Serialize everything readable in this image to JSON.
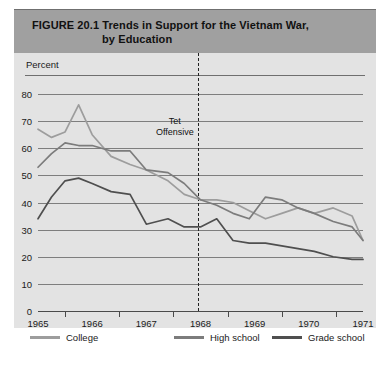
{
  "figure": {
    "number": "FIGURE 20.1",
    "title_line1": "Trends in Support for the Vietnam War,",
    "title_line2": "by Education"
  },
  "axis": {
    "y_title": "Percent",
    "y_ticks": [
      "80",
      "70",
      "60",
      "50",
      "40",
      "30",
      "20",
      "10",
      "0"
    ],
    "x_ticks": [
      "1965",
      "1966",
      "1967",
      "1968",
      "1969",
      "1970",
      "1971"
    ]
  },
  "annotation": {
    "tet_line1": "Tet",
    "tet_line2": "Offensive"
  },
  "legend": {
    "items": [
      {
        "label": "College",
        "color": "#9d9d9d"
      },
      {
        "label": "High school",
        "color": "#7c7c7c"
      },
      {
        "label": "Grade school",
        "color": "#4f4f4f"
      }
    ]
  },
  "colors": {
    "title_band": "#a0a0a0",
    "panel": "#e3e3e3",
    "gridline": "#7e7e7e",
    "axis": "#4a4a4a",
    "tet_dash": "#222222"
  },
  "chart_data": {
    "type": "line",
    "title": "FIGURE 20.1  Trends in Support for the Vietnam War, by Education",
    "xlabel": "",
    "ylabel": "Percent",
    "ylim": [
      0,
      80
    ],
    "xlim": [
      1965,
      1971
    ],
    "grid": true,
    "legend_position": "below",
    "x_tick_labels": [
      "1965",
      "1966",
      "1967",
      "1968",
      "1969",
      "1970",
      "1971"
    ],
    "annotations": [
      {
        "text": "Tet Offensive",
        "x": 1967.95,
        "type": "vertical-dashed-line"
      }
    ],
    "series": [
      {
        "name": "College",
        "color": "#9d9d9d",
        "x": [
          1965.0,
          1965.25,
          1965.5,
          1965.75,
          1966.0,
          1966.35,
          1966.7,
          1967.0,
          1967.4,
          1967.7,
          1968.0,
          1968.3,
          1968.6,
          1968.9,
          1969.2,
          1969.5,
          1969.8,
          1970.1,
          1970.45,
          1970.8,
          1971.0
        ],
        "y": [
          67,
          64,
          66,
          76,
          65,
          57,
          54,
          52,
          48,
          43,
          41,
          41,
          40,
          37,
          34,
          36,
          38,
          36,
          38,
          35,
          26
        ]
      },
      {
        "name": "High school",
        "color": "#7c7c7c",
        "x": [
          1965.0,
          1965.25,
          1965.5,
          1965.75,
          1966.0,
          1966.35,
          1966.7,
          1967.0,
          1967.4,
          1967.7,
          1968.0,
          1968.3,
          1968.6,
          1968.9,
          1969.2,
          1969.5,
          1969.8,
          1970.1,
          1970.45,
          1970.8,
          1971.0
        ],
        "y": [
          53,
          58,
          62,
          61,
          61,
          59,
          59,
          52,
          51,
          47,
          41,
          39,
          36,
          34,
          42,
          41,
          38,
          36,
          33,
          31,
          26
        ]
      },
      {
        "name": "Grade school",
        "color": "#4f4f4f",
        "x": [
          1965.0,
          1965.25,
          1965.5,
          1965.75,
          1966.0,
          1966.35,
          1966.7,
          1967.0,
          1967.4,
          1967.7,
          1968.0,
          1968.3,
          1968.6,
          1968.9,
          1969.2,
          1969.5,
          1969.8,
          1970.1,
          1970.45,
          1970.8,
          1971.0
        ],
        "y": [
          34,
          42,
          48,
          49,
          47,
          44,
          43,
          32,
          34,
          31,
          31,
          34,
          26,
          25,
          25,
          24,
          23,
          22,
          20,
          19,
          19
        ]
      }
    ]
  }
}
